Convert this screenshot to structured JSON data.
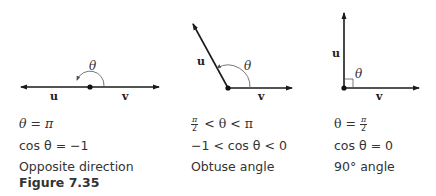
{
  "figure": {
    "label": "Figure 7.35",
    "panels": [
      {
        "id": "opposite",
        "vector_u_label": "u",
        "vector_v_label": "v",
        "angle_label": "θ",
        "caption_line1": {
          "lhs": "θ",
          "op": "=",
          "rhs": "π"
        },
        "caption_line2": {
          "text": "cos θ = −1"
        },
        "caption_line3": "Opposite direction"
      },
      {
        "id": "obtuse",
        "vector_u_label": "u",
        "vector_v_label": "v",
        "angle_label": "θ",
        "caption_line1": {
          "frac_num": "π",
          "frac_den": "2",
          "rest": " < θ < π"
        },
        "caption_line2": {
          "text": "−1 < cos θ < 0"
        },
        "caption_line3": "Obtuse angle"
      },
      {
        "id": "right",
        "vector_u_label": "u",
        "vector_v_label": "v",
        "angle_label": "θ",
        "caption_line1": {
          "lhs": "θ = ",
          "frac_num": "π",
          "frac_den": "2"
        },
        "caption_line2": {
          "text": "cos θ = 0"
        },
        "caption_line3": "90° angle"
      }
    ]
  },
  "colors": {
    "vector": "#1a1a1a",
    "arc": "#666666",
    "text": "#333333"
  }
}
